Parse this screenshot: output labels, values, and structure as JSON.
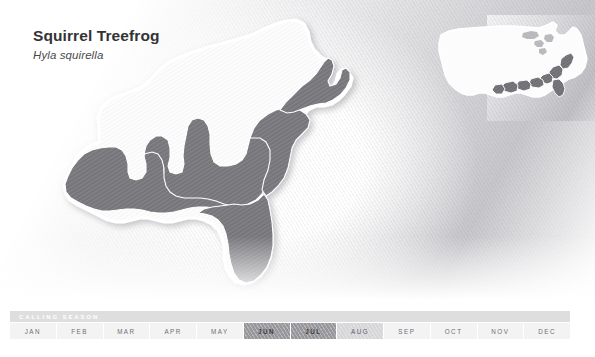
{
  "species": {
    "common_name": "Squirrel Treefrog",
    "scientific_name": "Hyla squirella"
  },
  "calling_season": {
    "label": "CALLING SEASON",
    "months": [
      {
        "label": "JAN",
        "level": "none"
      },
      {
        "label": "FEB",
        "level": "none"
      },
      {
        "label": "MAR",
        "level": "none"
      },
      {
        "label": "APR",
        "level": "none"
      },
      {
        "label": "MAY",
        "level": "none"
      },
      {
        "label": "JUN",
        "level": "high"
      },
      {
        "label": "JUL",
        "level": "high"
      },
      {
        "label": "AUG",
        "level": "medium"
      },
      {
        "label": "SEP",
        "level": "none"
      },
      {
        "label": "OCT",
        "level": "none"
      },
      {
        "label": "NOV",
        "level": "none"
      },
      {
        "label": "DEC",
        "level": "none"
      }
    ]
  },
  "map": {
    "region_description": "Southeastern United States",
    "range_fill_color": "#78787c",
    "outside_range_fill_color": "#fdfdfd",
    "outline_color": "#ffffff",
    "range_states": [
      "Florida",
      "Georgia",
      "South Carolina",
      "North Carolina",
      "Virginia",
      "Alabama",
      "Mississippi",
      "Louisiana",
      "East Texas",
      "Tennessee",
      "Arkansas"
    ],
    "inset": {
      "description": "United States locator map with southeastern range highlighted"
    }
  }
}
